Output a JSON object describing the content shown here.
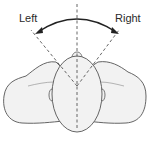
{
  "diagram": {
    "type": "head-rotation-top-view",
    "labels": {
      "left": "Left",
      "right": "Right",
      "bottom": ""
    },
    "colors": {
      "outline": "#555555",
      "fill": "#f2f2f2",
      "arrow": "#222222",
      "dashed": "#555555",
      "background": "#ffffff"
    }
  }
}
